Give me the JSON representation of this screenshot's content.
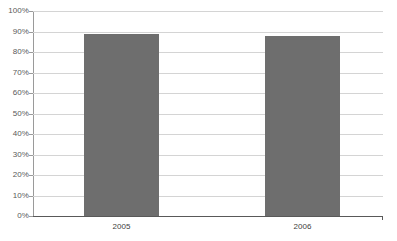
{
  "chart_data": {
    "type": "bar",
    "title": "",
    "subtitle": "",
    "xlabel": "",
    "ylabel": "",
    "categories": [
      "2005",
      "2006"
    ],
    "values": [
      0.89,
      0.88
    ],
    "value_labels": [
      "89%",
      "88%"
    ],
    "series": [
      {
        "name": "",
        "values": [
          0.89,
          0.88
        ]
      }
    ],
    "ylim": [
      0,
      1
    ],
    "ytick_values": [
      0,
      0.1,
      0.2,
      0.3,
      0.4,
      0.5,
      0.6,
      0.7,
      0.8,
      0.9,
      1.0
    ],
    "ytick_labels": [
      "0%",
      "10%",
      "20%",
      "30%",
      "40%",
      "50%",
      "60%",
      "70%",
      "80%",
      "90%",
      "100%"
    ],
    "grid": true,
    "grid_axis": "y",
    "legend": false,
    "legend_position": "none",
    "bar_color": "#6e6e6e",
    "gridline_color": "#d4d4d4",
    "axis_color": "#595959",
    "background_color": "#ffffff",
    "data_labels_visible": false
  }
}
